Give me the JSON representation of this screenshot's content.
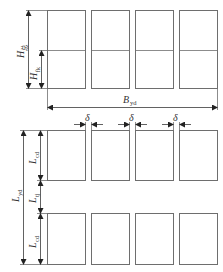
{
  "figure": {
    "top_panel": {
      "description": "Elevation: 4 columns, each divided into 2 storeys",
      "columns": 4,
      "rows": 2,
      "labels": {
        "total_height": {
          "main": "H",
          "sub": "总"
        },
        "storey_height": {
          "main": "H",
          "sub": "fk"
        },
        "total_width": {
          "main": "B",
          "sub": "yd"
        }
      }
    },
    "bottom_panel": {
      "description": "Plan: 2 rows x 4 blocks with gaps",
      "columns": 4,
      "rows": 2,
      "labels": {
        "gap": {
          "main": "δ"
        },
        "total_length": {
          "main": "L",
          "sub": "yd"
        },
        "block_length_top": {
          "main": "L",
          "sub": "cd"
        },
        "aisle_length": {
          "main": "L",
          "sub": "tj"
        },
        "block_length_bottom": {
          "main": "L",
          "sub": "cd"
        }
      }
    }
  }
}
